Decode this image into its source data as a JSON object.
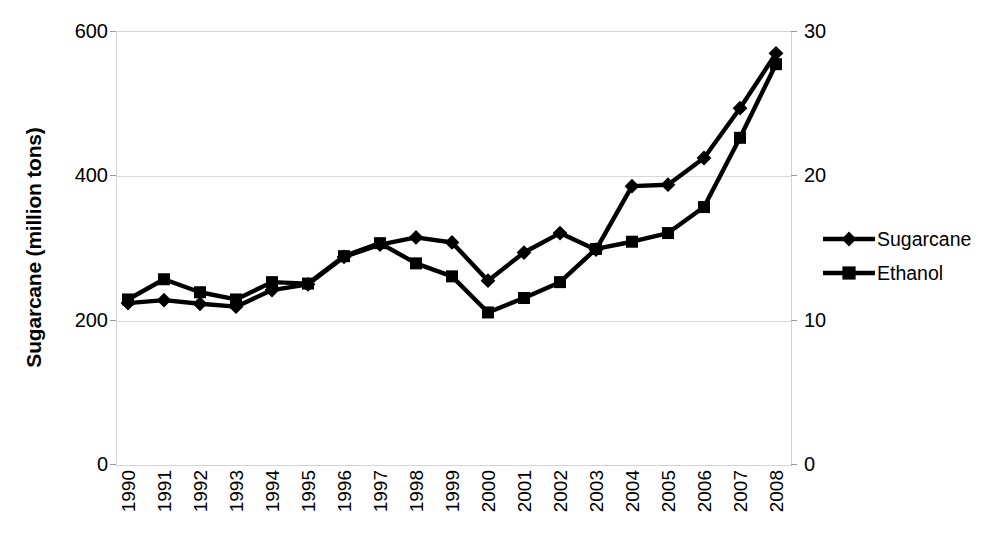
{
  "chart_data": {
    "type": "line",
    "title": "",
    "xlabel": "",
    "ylabel": "Sugarcane (million tons)",
    "y2label": "",
    "grid": true,
    "legend_position": "right",
    "categories": [
      "1990",
      "1991",
      "1992",
      "1993",
      "1994",
      "1995",
      "1996",
      "1997",
      "1998",
      "1999",
      "2000",
      "2001",
      "2002",
      "2003",
      "2004",
      "2005",
      "2006",
      "2007",
      "2008"
    ],
    "x": [
      1990,
      1991,
      1992,
      1993,
      1994,
      1995,
      1996,
      1997,
      1998,
      1999,
      2000,
      2001,
      2002,
      2003,
      2004,
      2005,
      2006,
      2007,
      2008
    ],
    "ylim": [
      0,
      600
    ],
    "y2lim": [
      0,
      30
    ],
    "yticks": [
      "0",
      "200",
      "400",
      "600"
    ],
    "ytick_values": [
      0,
      200,
      400,
      600
    ],
    "y2ticks": [
      "0",
      "10",
      "20",
      "30"
    ],
    "y2tick_values": [
      0,
      10,
      20,
      30
    ],
    "series": [
      {
        "name": "Sugarcane",
        "axis": "left",
        "marker": "diamond",
        "color": "#000000",
        "values": [
          223,
          227,
          222,
          218,
          241,
          249,
          287,
          304,
          314,
          307,
          254,
          293,
          320,
          297,
          385,
          387,
          424,
          493,
          569
        ]
      },
      {
        "name": "Ethanol",
        "axis": "right",
        "marker": "square",
        "color": "#000000",
        "values": [
          11.4,
          12.8,
          11.9,
          11.4,
          12.6,
          12.5,
          14.4,
          15.3,
          13.9,
          13.0,
          10.5,
          11.5,
          12.6,
          14.9,
          15.4,
          16.0,
          17.8,
          22.6,
          27.7
        ]
      }
    ],
    "legend": [
      {
        "label": "Sugarcane",
        "marker": "diamond"
      },
      {
        "label": "Ethanol",
        "marker": "square"
      }
    ]
  },
  "axes": {
    "y_title": "Sugarcane (million tons)"
  }
}
